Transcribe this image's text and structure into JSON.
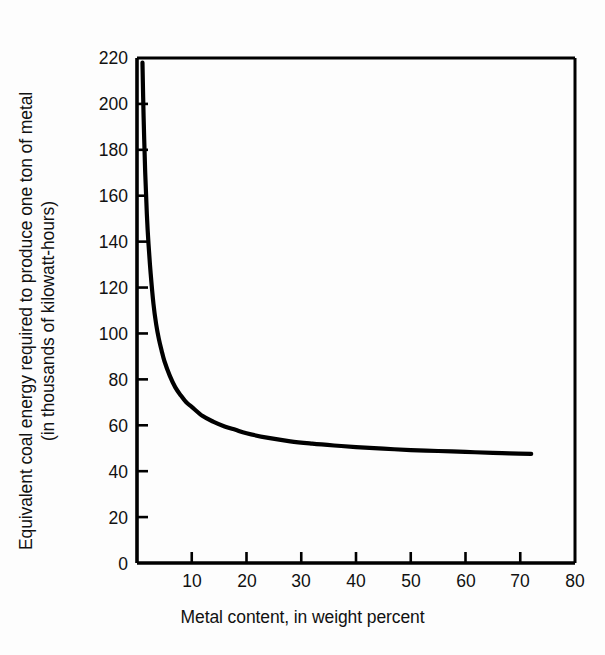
{
  "chart_data": {
    "type": "line",
    "title": "",
    "xlabel": "Metal content, in weight percent",
    "ylabel_line1": "Equivalent coal energy required to produce one ton of metal",
    "ylabel_line2": "(in thousands of kilowatt-hours)",
    "xlim": [
      0,
      80
    ],
    "ylim": [
      0,
      220
    ],
    "xticks": [
      0,
      10,
      20,
      30,
      40,
      50,
      60,
      70,
      80
    ],
    "xtick_labels": [
      "0",
      "10",
      "20",
      "30",
      "40",
      "50",
      "60",
      "70",
      "80"
    ],
    "yticks": [
      0,
      20,
      40,
      60,
      80,
      100,
      120,
      140,
      160,
      180,
      200,
      220
    ],
    "ytick_labels": [
      "0",
      "20",
      "40",
      "60",
      "80",
      "100",
      "120",
      "140",
      "160",
      "180",
      "200",
      "220"
    ],
    "grid": false,
    "legend": "none",
    "line_color": "#000000",
    "frame_color": "#000000",
    "background_color": "#ffffff",
    "series": [
      {
        "name": "Equivalent coal energy",
        "x": [
          1.0,
          1.2,
          1.5,
          1.8,
          2.1,
          2.5,
          3.0,
          3.5,
          4.0,
          4.5,
          5.0,
          6.0,
          7.0,
          8.0,
          9.0,
          10.0,
          12.0,
          14.0,
          16.0,
          18.0,
          20.0,
          24.0,
          28.0,
          32.0,
          36.0,
          40.0,
          45.0,
          50.0,
          55.0,
          60.0,
          65.0,
          68.0,
          72.0
        ],
        "y": [
          218.0,
          195.0,
          170.0,
          152.0,
          139.0,
          126.0,
          113.0,
          104.0,
          97.5,
          92.5,
          88.0,
          81.5,
          76.5,
          73.0,
          70.0,
          68.0,
          64.0,
          61.5,
          59.5,
          58.0,
          56.5,
          54.5,
          53.0,
          52.0,
          51.2,
          50.5,
          49.8,
          49.2,
          48.8,
          48.4,
          48.0,
          47.8,
          47.5
        ]
      }
    ]
  }
}
